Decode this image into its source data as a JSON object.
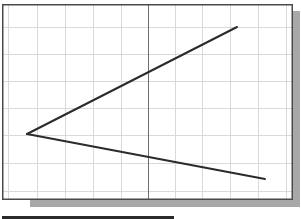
{
  "drawing": {
    "colors": {
      "background": "#ffffff",
      "grid": "#d9d9d9",
      "axis": "#6e6e6e",
      "frame": "#4a4a4a",
      "shadow": "#a8a8a8",
      "line": "#2b2b2b",
      "bottom_bar": "#2a2a2a"
    },
    "frame": {
      "x": 2,
      "y": 4,
      "width": 291,
      "height": 196
    },
    "shadow": {
      "offset": 7
    },
    "grid": {
      "vertical_x": [
        8,
        37,
        65,
        93,
        121,
        175,
        202,
        230,
        258,
        286
      ],
      "horizontal_y": [
        27,
        54,
        81,
        108,
        135,
        163,
        191
      ]
    },
    "axis_x": 148,
    "lines": [
      {
        "name": "upper-line",
        "x1": 27,
        "y1": 134,
        "x2": 237,
        "y2": 27
      },
      {
        "name": "lower-line",
        "x1": 27,
        "y1": 134,
        "x2": 265,
        "y2": 179
      }
    ],
    "bottom_bar": {
      "x": 2,
      "y": 216,
      "width": 172,
      "height": 3
    }
  }
}
